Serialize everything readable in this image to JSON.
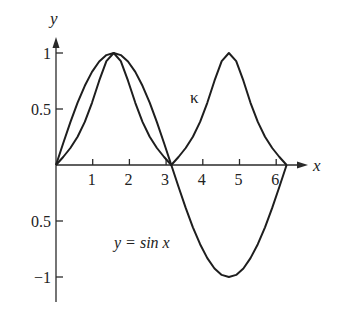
{
  "chart_data": {
    "type": "line",
    "title": "",
    "xlabel": "x",
    "ylabel": "y",
    "xlim": [
      0,
      6.6
    ],
    "ylim": [
      -1.2,
      1.15
    ],
    "grid": false,
    "legend": "none (curves labeled inline)",
    "x_ticks": [
      1,
      2,
      3,
      4,
      5,
      6
    ],
    "x_tick_labels": [
      "1",
      "2",
      "3",
      "4",
      "5",
      "6"
    ],
    "y_ticks": [
      1,
      0.5,
      -0.5,
      -1
    ],
    "y_tick_labels": [
      "1",
      "0.5",
      "0.5",
      "−1"
    ],
    "annotations": [
      {
        "text": "κ",
        "x": 3.8,
        "y": 0.6,
        "refers_to": "curvature"
      },
      {
        "text": "y = sin x",
        "x": 1.6,
        "y": -0.7,
        "refers_to": "sine"
      }
    ],
    "x": [
      0,
      0.196,
      0.393,
      0.589,
      0.785,
      0.982,
      1.178,
      1.374,
      1.571,
      1.767,
      1.963,
      2.16,
      2.356,
      2.553,
      2.749,
      2.945,
      3.142,
      3.338,
      3.534,
      3.731,
      3.927,
      4.123,
      4.32,
      4.516,
      4.712,
      4.909,
      5.105,
      5.301,
      5.498,
      5.694,
      5.89,
      6.087,
      6.283
    ],
    "series": [
      {
        "name": "y = sin x",
        "values": [
          0,
          0.195,
          0.383,
          0.556,
          0.707,
          0.831,
          0.924,
          0.981,
          1,
          0.981,
          0.924,
          0.831,
          0.707,
          0.556,
          0.383,
          0.195,
          0,
          -0.195,
          -0.383,
          -0.556,
          -0.707,
          -0.831,
          -0.924,
          -0.981,
          -1,
          -0.981,
          -0.924,
          -0.831,
          -0.707,
          -0.556,
          -0.383,
          -0.195,
          0
        ]
      },
      {
        "name": "κ (curvature)",
        "values": [
          0,
          0.071,
          0.152,
          0.253,
          0.385,
          0.555,
          0.753,
          0.927,
          1,
          0.927,
          0.753,
          0.555,
          0.385,
          0.253,
          0.152,
          0.071,
          0,
          0.071,
          0.152,
          0.253,
          0.385,
          0.555,
          0.753,
          0.927,
          1,
          0.927,
          0.753,
          0.555,
          0.385,
          0.253,
          0.152,
          0.071,
          0
        ]
      }
    ]
  },
  "labels": {
    "y_axis": "y",
    "x_axis": "x",
    "kappa": "κ",
    "sine": "y = sin x"
  }
}
